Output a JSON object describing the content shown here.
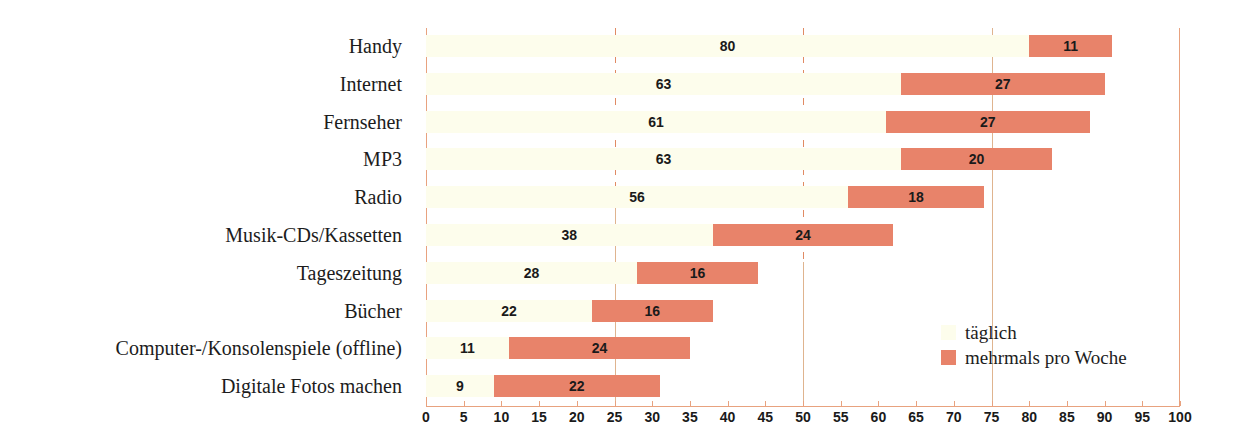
{
  "chart_data": {
    "type": "bar",
    "subtype": "stacked-horizontal-bar",
    "title": "",
    "xlabel": "",
    "ylabel": "",
    "xlim": [
      0,
      100
    ],
    "xticks": [
      0,
      5,
      10,
      15,
      20,
      25,
      30,
      35,
      40,
      45,
      50,
      55,
      60,
      65,
      70,
      75,
      80,
      85,
      90,
      95,
      100
    ],
    "grid": true,
    "gridlines": [
      25,
      50,
      75
    ],
    "legend_position": "bottom-right",
    "categories": [
      "Handy",
      "Internet",
      "Fernseher",
      "MP3",
      "Radio",
      "Musik-CDs/Kassetten",
      "Tageszeitung",
      "Bücher",
      "Computer-/Konsolenspiele (offline)",
      "Digitale Fotos machen"
    ],
    "series": [
      {
        "name": "täglich",
        "color": "#fdfdec",
        "values": [
          80,
          63,
          61,
          63,
          56,
          38,
          28,
          22,
          11,
          9
        ]
      },
      {
        "name": "mehrmals pro Woche",
        "color": "#e8836a",
        "values": [
          11,
          27,
          27,
          20,
          18,
          24,
          16,
          16,
          24,
          22
        ]
      }
    ],
    "totals": [
      91,
      90,
      88,
      83,
      74,
      62,
      44,
      38,
      35,
      31
    ]
  },
  "legend": {
    "items": [
      {
        "label": "täglich",
        "color": "#fdfdec"
      },
      {
        "label": "mehrmals pro Woche",
        "color": "#e8836a"
      }
    ]
  },
  "colors": {
    "daily": "#fdfdec",
    "weekly": "#e8836a",
    "axis": "#e8a27f",
    "gridline_dashed": "#e08a63",
    "gridline_solid": "#dfb48f",
    "text": "#1c1c1c",
    "background": "#ffffff"
  }
}
